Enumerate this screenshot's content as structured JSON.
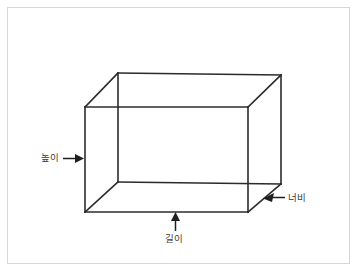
{
  "figure": {
    "kind": "cuboid-dimensions-diagram",
    "frame_color": "#d6d6d6",
    "background_color": "#ffffff",
    "edge_color": "#2b2b2b",
    "label_color": "#3c3c3c"
  },
  "labels": {
    "height": "높이",
    "width": "너비",
    "length": "길이"
  },
  "annotations": [
    {
      "name": "height-arrow",
      "label": "높이",
      "direction": "right",
      "points_to": "left-vertical-edge"
    },
    {
      "name": "width-arrow",
      "label": "너비",
      "direction": "left",
      "points_to": "bottom-right-depth-edge"
    },
    {
      "name": "length-arrow",
      "label": "길이",
      "direction": "up",
      "points_to": "front-bottom-edge"
    }
  ],
  "geometry": {
    "front_face": {
      "top_left": [
        85,
        107
      ],
      "top_right": [
        248,
        107
      ],
      "bottom_right": [
        248,
        212
      ],
      "bottom_left": [
        85,
        212
      ]
    },
    "back_face": {
      "top_left": [
        118,
        73
      ],
      "top_right": [
        281,
        75
      ],
      "bottom_right": [
        281,
        184
      ],
      "bottom_left": [
        118,
        182
      ]
    }
  }
}
